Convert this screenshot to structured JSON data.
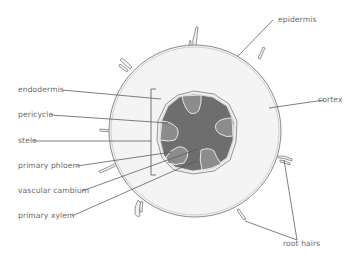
{
  "colors": {
    "background": "#ffffff",
    "cortex": "#f4f4f4",
    "outline": "#8a8a8a",
    "stele_dark": "#6e6e6e",
    "lobe": "#8c8c8c",
    "leader": "#555555",
    "label": "#6b6b6b"
  },
  "labels": {
    "left": [
      {
        "id": "endodermis",
        "text": "endodermis"
      },
      {
        "id": "pericycle",
        "text": "pericycle"
      },
      {
        "id": "stele",
        "text": "stele"
      },
      {
        "id": "primary_phloem",
        "text": "primary phloem"
      },
      {
        "id": "vascular_cambium",
        "text": "vascular cambium"
      },
      {
        "id": "primary_xylem",
        "text": "primary xylem"
      }
    ],
    "right": [
      {
        "id": "epidermis",
        "text": "epidermis"
      },
      {
        "id": "cortex",
        "text": "cortex"
      },
      {
        "id": "root_hairs",
        "text": "root hairs"
      }
    ]
  }
}
